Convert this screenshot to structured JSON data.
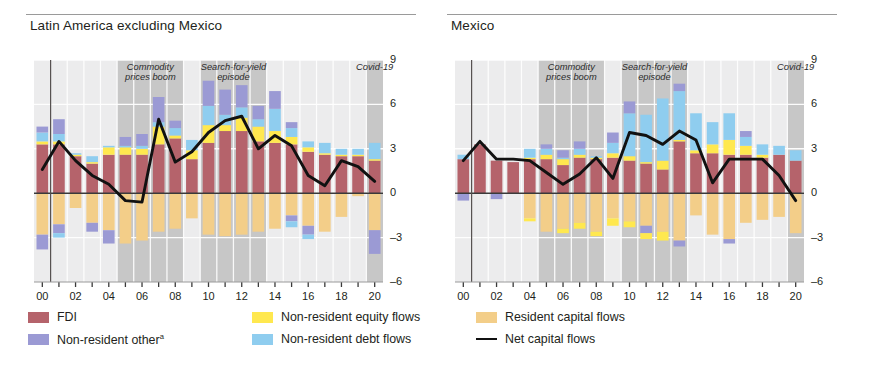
{
  "figure": {
    "panels": [
      {
        "key": "latam_ex_mexico",
        "title": "Latin America excluding Mexico"
      },
      {
        "key": "mexico",
        "title": "Mexico"
      }
    ]
  },
  "axis": {
    "y_ticks": [
      "9",
      "6",
      "3",
      "0",
      "–3",
      "–6"
    ],
    "y_values": [
      9,
      6,
      3,
      0,
      -3,
      -6
    ],
    "ylim": [
      -6,
      9
    ],
    "x_ticks": [
      "00",
      "02",
      "04",
      "06",
      "08",
      "10",
      "12",
      "14",
      "16",
      "18",
      "20"
    ],
    "x_tick_values": [
      2000,
      2002,
      2004,
      2006,
      2008,
      2010,
      2012,
      2014,
      2016,
      2018,
      2020
    ]
  },
  "bands": [
    {
      "name": "commodity-prices-boom",
      "label": "Commodity\nprices boom",
      "start": 2004.5,
      "end": 2008.5
    },
    {
      "name": "search-for-yield-episode",
      "label": "Search-for-yield\nepisode",
      "start": 2009.5,
      "end": 2013.5
    },
    {
      "name": "covid-19",
      "label": "Covid-19",
      "start": 2019.5,
      "end": 2020.5
    }
  ],
  "legend": {
    "items": [
      {
        "name": "fdi",
        "label": "FDI",
        "color": "#b5636b",
        "type": "swatch"
      },
      {
        "name": "non-resident-other",
        "label": "Non-resident other",
        "sup": "a",
        "color": "#9b9ad4",
        "type": "swatch"
      },
      {
        "name": "non-resident-equity-flows",
        "label": "Non-resident equity flows",
        "color": "#ffe84f",
        "type": "swatch"
      },
      {
        "name": "non-resident-debt-flows",
        "label": "Non-resident debt flows",
        "color": "#8fcdef",
        "type": "swatch"
      },
      {
        "name": "resident-capital-flows",
        "label": "Resident capital flows",
        "color": "#f3ce89",
        "type": "swatch"
      },
      {
        "name": "net-capital-flows",
        "label": "Net capital flows",
        "color": "#111111",
        "type": "line"
      }
    ]
  },
  "colors": {
    "fdi": "#b5636b",
    "non_resident_other": "#9b9ad4",
    "non_resident_equity": "#ffe84f",
    "non_resident_debt": "#8fcdef",
    "resident": "#f3ce89",
    "net_line": "#111111",
    "band": "#c3c3c3",
    "gridline": "#ffffff",
    "plot_bg": "#ececed",
    "axis": "#3a3a3a"
  },
  "chart_data": [
    {
      "type": "bar",
      "panel": "Latin America excluding Mexico",
      "title": "Latin America excluding Mexico",
      "stacked": true,
      "xlabel": "",
      "ylabel": "",
      "ylim": [
        -6,
        9
      ],
      "grid": true,
      "legend_position": "bottom",
      "x": [
        2000,
        2001,
        2002,
        2003,
        2004,
        2005,
        2006,
        2007,
        2008,
        2009,
        2010,
        2011,
        2012,
        2013,
        2014,
        2015,
        2016,
        2017,
        2018,
        2019,
        2020
      ],
      "categories": [
        "2000",
        "2001",
        "2002",
        "2003",
        "2004",
        "2005",
        "2006",
        "2007",
        "2008",
        "2009",
        "2010",
        "2011",
        "2012",
        "2013",
        "2014",
        "2015",
        "2016",
        "2017",
        "2018",
        "2019",
        "2020"
      ],
      "series": [
        {
          "name": "FDI",
          "color": "#b5636b",
          "values": [
            3.3,
            3.3,
            2.5,
            2.0,
            2.6,
            2.6,
            2.6,
            3.3,
            3.7,
            2.3,
            3.4,
            4.2,
            4.2,
            3.5,
            3.4,
            3.3,
            2.8,
            2.6,
            2.5,
            2.5,
            2.2
          ]
        },
        {
          "name": "Non-resident equity flows",
          "color": "#ffe84f",
          "values": [
            0.2,
            0.2,
            0.1,
            0.1,
            0.5,
            0.5,
            0.4,
            1.2,
            0.2,
            0.6,
            1.2,
            0.4,
            0.9,
            1.0,
            0.8,
            0.5,
            0.3,
            0.1,
            0.1,
            0.1,
            0.1
          ]
        },
        {
          "name": "Non-resident debt flows",
          "color": "#8fcdef",
          "values": [
            0.6,
            0.5,
            0.1,
            0.4,
            0.1,
            0.1,
            0.2,
            0.3,
            0.5,
            0.7,
            1.3,
            0.7,
            0.7,
            0.5,
            1.5,
            0.6,
            0.4,
            0.7,
            0.4,
            0.4,
            1.1
          ]
        },
        {
          "name": "Non-resident other",
          "color": "#9b9ad4",
          "values": [
            0.4,
            1.0,
            0.0,
            0.0,
            0.0,
            0.6,
            0.8,
            1.7,
            0.5,
            0.0,
            1.7,
            1.7,
            1.5,
            0.9,
            1.2,
            0.4,
            0.0,
            0.0,
            0.0,
            0.0,
            0.0
          ]
        },
        {
          "name": "Resident capital flows",
          "color": "#f3ce89",
          "values": [
            -2.8,
            -2.1,
            -1.0,
            -2.0,
            -2.5,
            -3.4,
            -3.2,
            -2.6,
            -2.4,
            -1.7,
            -2.8,
            -2.9,
            -2.8,
            -2.6,
            -2.4,
            -1.5,
            -2.2,
            -2.6,
            -1.6,
            -0.2,
            -2.5
          ]
        },
        {
          "name": "Non-resident other (negative)",
          "color": "#9b9ad4",
          "values": [
            -1.0,
            -0.6,
            0.0,
            -0.6,
            -0.9,
            0.0,
            0.0,
            0.0,
            0.0,
            0.0,
            0.0,
            0.0,
            0.0,
            0.0,
            0.0,
            -0.4,
            -0.6,
            0.0,
            0.0,
            0.0,
            -1.6
          ]
        },
        {
          "name": "Non-resident debt flows (negative)",
          "color": "#8fcdef",
          "values": [
            0.0,
            -0.3,
            0.0,
            0.0,
            0.0,
            0.0,
            0.0,
            0.0,
            0.0,
            0.0,
            0.0,
            0.0,
            0.0,
            0.0,
            0.0,
            -0.4,
            -0.3,
            0.0,
            0.0,
            0.0,
            0.0
          ]
        }
      ],
      "line_series": {
        "name": "Net capital flows",
        "color": "#111111",
        "values": [
          1.6,
          3.5,
          2.2,
          1.2,
          0.6,
          -0.5,
          -0.6,
          5.0,
          2.1,
          2.8,
          4.1,
          4.9,
          5.2,
          3.0,
          3.9,
          3.2,
          1.2,
          0.5,
          2.2,
          1.8,
          0.8
        ]
      }
    },
    {
      "type": "bar",
      "panel": "Mexico",
      "title": "Mexico",
      "stacked": true,
      "xlabel": "",
      "ylabel": "",
      "ylim": [
        -6,
        9
      ],
      "grid": true,
      "legend_position": "bottom",
      "x": [
        2000,
        2001,
        2002,
        2003,
        2004,
        2005,
        2006,
        2007,
        2008,
        2009,
        2010,
        2011,
        2012,
        2013,
        2014,
        2015,
        2016,
        2017,
        2018,
        2019,
        2020
      ],
      "categories": [
        "2000",
        "2001",
        "2002",
        "2003",
        "2004",
        "2005",
        "2006",
        "2007",
        "2008",
        "2009",
        "2010",
        "2011",
        "2012",
        "2013",
        "2014",
        "2015",
        "2016",
        "2017",
        "2018",
        "2019",
        "2020"
      ],
      "series": [
        {
          "name": "FDI",
          "color": "#b5636b",
          "values": [
            2.3,
            3.3,
            2.2,
            2.1,
            2.3,
            2.3,
            1.9,
            2.4,
            2.3,
            2.4,
            2.2,
            2.0,
            1.6,
            3.5,
            2.7,
            2.7,
            2.6,
            2.6,
            2.4,
            2.6,
            2.2
          ]
        },
        {
          "name": "Non-resident equity flows",
          "color": "#ffe84f",
          "values": [
            0.0,
            0.0,
            0.0,
            0.0,
            0.1,
            0.3,
            0.4,
            0.2,
            0.1,
            0.3,
            0.3,
            0.1,
            0.6,
            0.1,
            0.2,
            0.6,
            1.0,
            0.6,
            0.2,
            0.0,
            0.0
          ]
        },
        {
          "name": "Non-resident debt flows",
          "color": "#8fcdef",
          "values": [
            0.3,
            0.0,
            0.0,
            0.0,
            0.6,
            0.4,
            0.1,
            0.4,
            0.1,
            0.7,
            2.9,
            3.2,
            4.2,
            3.3,
            2.5,
            1.5,
            1.8,
            0.6,
            0.7,
            0.6,
            0.7
          ]
        },
        {
          "name": "Non-resident other",
          "color": "#9b9ad4",
          "values": [
            0.0,
            0.0,
            0.0,
            0.0,
            0.0,
            0.3,
            0.5,
            0.5,
            0.0,
            0.7,
            0.8,
            0.0,
            0.0,
            0.5,
            0.0,
            0.0,
            0.0,
            0.4,
            0.0,
            0.0,
            0.0
          ]
        },
        {
          "name": "Resident capital flows",
          "color": "#f3ce89",
          "values": [
            0.0,
            0.0,
            0.0,
            0.0,
            -1.7,
            -2.6,
            -2.4,
            -2.0,
            -2.6,
            -1.7,
            -1.9,
            -2.2,
            -2.6,
            -3.2,
            -1.5,
            -2.8,
            -3.1,
            -2.0,
            -1.8,
            -1.6,
            -2.7
          ]
        },
        {
          "name": "Non-resident other (negative)",
          "color": "#9b9ad4",
          "values": [
            -0.5,
            0.0,
            -0.4,
            0.0,
            0.0,
            0.0,
            0.0,
            0.0,
            0.0,
            0.0,
            0.0,
            -0.5,
            0.0,
            -0.4,
            0.0,
            0.0,
            -0.3,
            0.0,
            0.0,
            0.0,
            0.0
          ]
        },
        {
          "name": "Non-resident equity flows (negative)",
          "color": "#ffe84f",
          "values": [
            0.0,
            0.0,
            0.0,
            0.0,
            -0.2,
            0.0,
            -0.3,
            -0.4,
            -0.3,
            -0.5,
            -0.4,
            -0.4,
            -0.6,
            0.0,
            0.0,
            0.0,
            0.0,
            0.0,
            0.0,
            0.0,
            0.0
          ]
        }
      ],
      "line_series": {
        "name": "Net capital flows",
        "color": "#111111",
        "values": [
          2.2,
          3.5,
          2.3,
          2.3,
          2.2,
          1.4,
          0.6,
          1.3,
          2.4,
          1.0,
          4.1,
          3.9,
          3.3,
          4.2,
          3.6,
          0.7,
          2.3,
          2.3,
          2.3,
          1.2,
          -0.5
        ]
      }
    }
  ]
}
